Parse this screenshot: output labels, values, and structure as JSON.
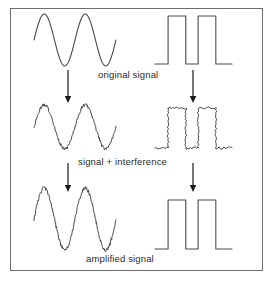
{
  "figure": {
    "border_color": "#6e6e6e",
    "background": "#ffffff",
    "stroke_color": "#4a4a4a",
    "arrow_color": "#1a1a1a",
    "text_color": "#2b2b2b"
  },
  "captions": {
    "original": "original signal",
    "interference": "signal + interference",
    "amplified": "amplified signal"
  },
  "chart_data": {
    "type": "line",
    "xlabel": "",
    "ylabel": "",
    "grid": false,
    "legend": "none",
    "rows": [
      {
        "row": 1,
        "stage": "original signal",
        "noise": "none",
        "amplitude_relative": 1.0,
        "waveforms": [
          {
            "name": "analogue-sine-clean",
            "type": "sine",
            "cycles": 2,
            "noisy": false,
            "phase": "starts at mid level rising to peak",
            "x_range": [
              34,
              116
            ],
            "y_center": 40,
            "amplitude_px": 26
          },
          {
            "name": "digital-square-clean",
            "type": "square",
            "pulses": 2,
            "noisy": false,
            "phase": "starts low, two high pulses, ends low",
            "x_range": [
              155,
              232
            ],
            "y_low": 64,
            "y_high": 16
          }
        ]
      },
      {
        "row": 2,
        "stage": "signal + interference",
        "noise": "added",
        "amplitude_relative": 1.0,
        "waveforms": [
          {
            "name": "analogue-sine-noisy",
            "type": "sine",
            "cycles": 2,
            "noisy": true,
            "noise_amplitude_px": 1.6,
            "x_range": [
              34,
              116
            ],
            "y_center": 127,
            "amplitude_px": 22
          },
          {
            "name": "digital-square-noisy",
            "type": "square",
            "pulses": 2,
            "noisy": true,
            "noise_amplitude_px": 1.3,
            "x_range": [
              155,
              232
            ],
            "y_low": 148,
            "y_high": 108
          }
        ]
      },
      {
        "row": 3,
        "stage": "amplified signal",
        "noise": "amplified with signal",
        "amplitude_relative": 1.35,
        "waveforms": [
          {
            "name": "analogue-sine-amplified-noisy",
            "type": "sine",
            "cycles": 2,
            "noisy": true,
            "noise_amplitude_px": 1.8,
            "x_range": [
              34,
              116
            ],
            "y_center": 219,
            "amplitude_px": 31
          },
          {
            "name": "digital-square-regenerated",
            "type": "square",
            "pulses": 2,
            "noisy": false,
            "x_range": [
              155,
              232
            ],
            "y_low": 249,
            "y_high": 200
          }
        ]
      }
    ],
    "arrows": [
      {
        "name": "arrow-analogue-1",
        "x": 68,
        "y_from": 70,
        "y_to": 103,
        "direction": "down"
      },
      {
        "name": "arrow-digital-1",
        "x": 193,
        "y_from": 70,
        "y_to": 103,
        "direction": "down"
      },
      {
        "name": "arrow-analogue-2",
        "x": 68,
        "y_from": 163,
        "y_to": 192,
        "direction": "down"
      },
      {
        "name": "arrow-digital-2",
        "x": 193,
        "y_from": 163,
        "y_to": 192,
        "direction": "down"
      }
    ]
  }
}
